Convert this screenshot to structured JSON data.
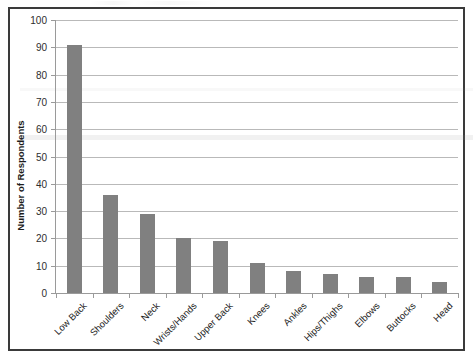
{
  "chart_data": {
    "type": "bar",
    "title": "",
    "xlabel": "",
    "ylabel": "Number of Respondents",
    "categories": [
      "Low Back",
      "Shoulders",
      "Neck",
      "Wrists/Hands",
      "Upper Back",
      "Knees",
      "Ankles",
      "Hips/Thighs",
      "Elbows",
      "Buttocks",
      "Head"
    ],
    "values": [
      91,
      36,
      29,
      20,
      19,
      11,
      8,
      7,
      6,
      6,
      4
    ],
    "ylim": [
      0,
      100
    ],
    "yticks": [
      0,
      10,
      20,
      30,
      40,
      50,
      60,
      70,
      80,
      90,
      100
    ],
    "ytick_labels": [
      "0",
      "10",
      "20",
      "30",
      "40",
      "50",
      "60",
      "70",
      "80",
      "90",
      "100"
    ],
    "grid": true,
    "legend": false,
    "legend_position": "none",
    "bar_color": "#808080",
    "gridline_color": "#b9b9b9",
    "axis_color": "#9a9a9a",
    "frame_color": "#3a3a3a",
    "background_color": "#ffffff",
    "xtick_label_rotation": -45
  }
}
